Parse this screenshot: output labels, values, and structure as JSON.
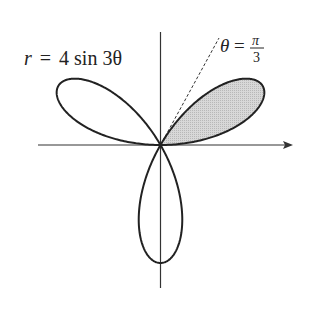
{
  "figure": {
    "equation_label": "r = 4 sin 3θ",
    "equation_parts": {
      "r": "r",
      "eq": "=",
      "rhs": "4 sin 3θ"
    },
    "line_label": {
      "theta": "θ",
      "eq": "=",
      "num": "π",
      "den": "3"
    },
    "curve": {
      "type": "rose",
      "a": 4,
      "k": 3,
      "function": "r = 4 sin 3θ"
    },
    "shaded_region": {
      "from_theta": "0",
      "to_theta": "π/3",
      "color": "#cfcfcf"
    },
    "dashed_ray": {
      "theta": "π/3"
    },
    "colors": {
      "curve": "#222222",
      "axes": "#333333",
      "shade": "#cfcfcf"
    }
  }
}
